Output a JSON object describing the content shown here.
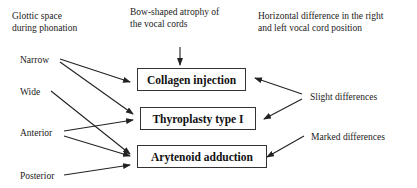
{
  "headers": {
    "glottic": [
      "Glottic space",
      "during phonation"
    ],
    "bow": [
      "Bow-shaped atrophy of",
      "the vocal cords"
    ],
    "horizontal": [
      "Horizontal difference in the right",
      "and left vocal cord position"
    ]
  },
  "left_labels": {
    "narrow": "Narrow",
    "wide": "Wide",
    "anterior": "Anterior",
    "posterior": "Posterior"
  },
  "boxes": {
    "collagen": "Collagen injection",
    "thyroplasty": "Thyroplasty type I",
    "arytenoid": "Arytenoid adduction"
  },
  "right_labels": {
    "slight": "Slight differences",
    "marked": "Marked differences"
  },
  "colors": {
    "line": "#222222",
    "background": "#ffffff"
  }
}
